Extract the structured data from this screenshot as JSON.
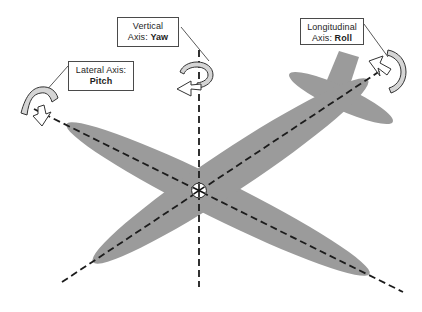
{
  "colors": {
    "background": "#ffffff",
    "airplane": "#9b9b9b",
    "ribbon": "#d5d5d5",
    "line": "#1c1c1c"
  },
  "labels": {
    "vertical": {
      "line1": "Vertical",
      "line2_prefix": "Axis: ",
      "line2_bold": "Yaw"
    },
    "lateral": {
      "line1": "Lateral Axis:",
      "line2_bold": "Pitch"
    },
    "longitudinal": {
      "line1": "Longitudinal",
      "line2_prefix": "Axis: ",
      "line2_bold": "Roll"
    }
  },
  "icons": {
    "cg_marker": "center-of-gravity-symbol",
    "pitch_arrow": "curved-rotation-arrow",
    "yaw_arrow": "curved-rotation-arrow",
    "roll_arrow": "curved-rotation-arrow"
  }
}
